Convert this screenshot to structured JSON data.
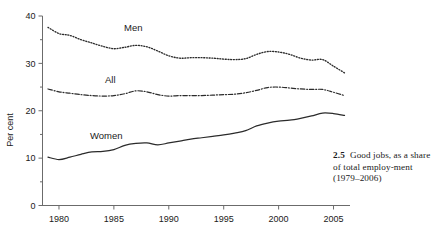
{
  "figure": {
    "caption_number": "2.5",
    "caption_text": "Good jobs, as a share of total employ-ment (1979–2006)"
  },
  "axes": {
    "ylabel": "Per cent",
    "ytick_labels": [
      "0",
      "10",
      "20",
      "30",
      "40"
    ],
    "xtick_labels": [
      "1980",
      "1985",
      "1990",
      "1995",
      "2000",
      "2005"
    ]
  },
  "series_labels": {
    "men": "Men",
    "all": "All",
    "women": "Women"
  },
  "colors": {
    "line": "#2b2b2b",
    "axis": "#6b6b6b",
    "text": "#1a1a1a",
    "background": "#ffffff"
  },
  "chart_data": {
    "type": "line",
    "xlabel": "",
    "ylabel": "Per cent",
    "xlim": [
      1978.5,
      2006.5
    ],
    "ylim": [
      0,
      40
    ],
    "xticks": [
      1980,
      1985,
      1990,
      1995,
      2000,
      2005
    ],
    "yticks": [
      0,
      10,
      20,
      30,
      40
    ],
    "yticks_minor": [
      5,
      15,
      25,
      35
    ],
    "grid": false,
    "legend": "inline-labels",
    "x": [
      1979,
      1980,
      1981,
      1982,
      1983,
      1984,
      1985,
      1986,
      1987,
      1988,
      1989,
      1990,
      1991,
      1992,
      1993,
      1994,
      1995,
      1996,
      1997,
      1998,
      1999,
      2000,
      2001,
      2002,
      2003,
      2004,
      2005,
      2006
    ],
    "series": [
      {
        "name": "Men",
        "style": "dotted",
        "values": [
          37.6,
          36.3,
          35.9,
          35.0,
          34.3,
          33.6,
          33.1,
          33.4,
          33.8,
          33.5,
          32.6,
          31.6,
          31.1,
          31.2,
          31.2,
          31.1,
          30.9,
          30.8,
          31.0,
          31.9,
          32.5,
          32.4,
          31.9,
          31.1,
          30.7,
          30.8,
          29.4,
          28.0
        ]
      },
      {
        "name": "All",
        "style": "dash-dot",
        "values": [
          24.6,
          24.0,
          23.7,
          23.4,
          23.2,
          23.1,
          23.2,
          23.6,
          24.2,
          24.0,
          23.4,
          23.1,
          23.2,
          23.2,
          23.2,
          23.3,
          23.4,
          23.5,
          23.8,
          24.3,
          24.9,
          25.0,
          24.8,
          24.6,
          24.5,
          24.5,
          23.9,
          23.2
        ]
      },
      {
        "name": "Women",
        "style": "solid",
        "values": [
          10.2,
          9.7,
          10.2,
          10.8,
          11.3,
          11.4,
          11.8,
          12.7,
          13.1,
          13.2,
          12.8,
          13.2,
          13.6,
          14.0,
          14.3,
          14.6,
          14.9,
          15.3,
          15.8,
          16.8,
          17.4,
          17.8,
          18.0,
          18.4,
          18.9,
          19.5,
          19.4,
          19.0
        ]
      }
    ]
  }
}
